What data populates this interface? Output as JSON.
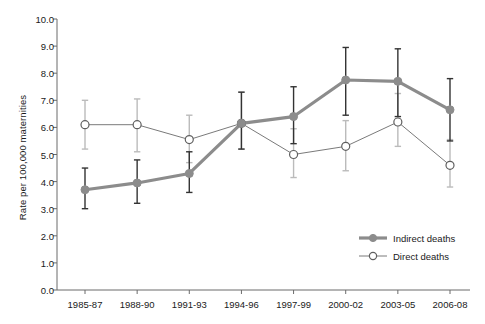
{
  "chart_data": {
    "type": "line",
    "title": "",
    "xlabel": "",
    "ylabel": "Rate per 100,000 maternities",
    "ylim": [
      0.0,
      10.0
    ],
    "ytick_labels": [
      "0.0",
      "1.0",
      "2.0",
      "3.0",
      "4.0",
      "5.0",
      "6.0",
      "7.0",
      "8.0",
      "9.0",
      "10.0"
    ],
    "ytick_values": [
      0.0,
      1.0,
      2.0,
      3.0,
      4.0,
      5.0,
      6.0,
      7.0,
      8.0,
      9.0,
      10.0
    ],
    "grid": false,
    "legend_position": "inside-lower-right",
    "categories": [
      "1985-87",
      "1988-90",
      "1991-93",
      "1994-96",
      "1997-99",
      "2000-02",
      "2003-05",
      "2006-08"
    ],
    "series": [
      {
        "name": "Indirect deaths",
        "marker": "filled-circle",
        "color": "#8c8c8c",
        "line_width": 3.2,
        "errorbar_color": "#333333",
        "values": [
          3.7,
          3.95,
          4.3,
          6.15,
          6.4,
          7.75,
          7.7,
          6.65
        ],
        "err_low": [
          3.0,
          3.2,
          3.6,
          5.2,
          5.4,
          6.45,
          6.4,
          5.5
        ],
        "err_high": [
          4.5,
          4.8,
          5.1,
          7.3,
          7.5,
          8.95,
          8.9,
          7.8
        ]
      },
      {
        "name": "Direct deaths",
        "marker": "open-circle",
        "color": "#7a7a7a",
        "line_width": 1.0,
        "errorbar_color": "#bbbbbb",
        "values": [
          6.1,
          6.1,
          5.55,
          6.15,
          5.0,
          5.3,
          6.2,
          4.6
        ],
        "err_low": [
          5.2,
          5.1,
          4.7,
          5.2,
          4.15,
          4.4,
          5.3,
          3.8
        ],
        "err_high": [
          7.0,
          7.05,
          6.45,
          7.3,
          5.95,
          6.25,
          7.25,
          5.55
        ]
      }
    ]
  },
  "legend": {
    "items": [
      {
        "label": "Indirect deaths"
      },
      {
        "label": "Direct deaths"
      }
    ]
  },
  "colors": {
    "indirect_line": "#8c8c8c",
    "direct_line": "#7a7a7a",
    "indirect_error": "#333333",
    "direct_error": "#bbbbbb",
    "axis": "#6b6b6b",
    "text": "#1a1a1a"
  }
}
